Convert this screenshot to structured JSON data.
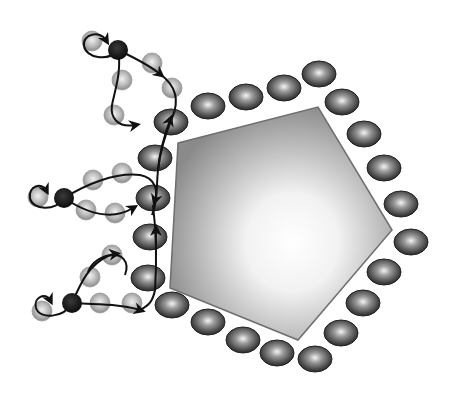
{
  "figure": {
    "colors": {
      "background": "#ffffff",
      "particle_edge": "#6e6e6e",
      "particle_center": "#ffffff",
      "particle_outer": "#8c8c8c",
      "ligand_dark": "#3a3a3a",
      "ligand_light": "#d8d8d8",
      "bead_light": "#b0b0b0",
      "anchor_black": "#141414",
      "path_stroke": "#111111"
    },
    "particle": {
      "shape": "pentagon",
      "vertices": [
        [
          178,
          143
        ],
        [
          318,
          107
        ],
        [
          392,
          230
        ],
        [
          298,
          340
        ],
        [
          170,
          288
        ]
      ]
    },
    "ligands": [
      [
        208,
        106
      ],
      [
        246,
        97
      ],
      [
        284,
        88
      ],
      [
        319,
        74
      ],
      [
        342,
        102
      ],
      [
        364,
        134
      ],
      [
        384,
        168
      ],
      [
        401,
        204
      ],
      [
        411,
        242
      ],
      [
        384,
        272
      ],
      [
        363,
        303
      ],
      [
        341,
        333
      ],
      [
        315,
        359
      ],
      [
        277,
        353
      ],
      [
        243,
        340
      ],
      [
        208,
        322
      ],
      [
        172,
        305
      ],
      [
        148,
        278
      ],
      [
        150,
        237
      ],
      [
        153,
        198
      ],
      [
        155,
        158
      ],
      [
        171,
        122
      ]
    ],
    "chains": [
      {
        "name": "chain-top",
        "anchor": [
          118,
          50
        ],
        "beads": [
          [
            92,
            41
          ],
          [
            152,
            63
          ],
          [
            122,
            80
          ],
          [
            172,
            88
          ],
          [
            114,
            115
          ]
        ]
      },
      {
        "name": "chain-middle",
        "anchor": [
          64,
          198
        ],
        "beads": [
          [
            38,
            197
          ],
          [
            93,
            180
          ],
          [
            122,
            173
          ],
          [
            86,
            210
          ],
          [
            115,
            213
          ]
        ]
      },
      {
        "name": "chain-bottom",
        "anchor": [
          72,
          303
        ],
        "beads": [
          [
            42,
            311
          ],
          [
            90,
            277
          ],
          [
            112,
            255
          ],
          [
            100,
            303
          ],
          [
            132,
            303
          ]
        ]
      }
    ]
  }
}
